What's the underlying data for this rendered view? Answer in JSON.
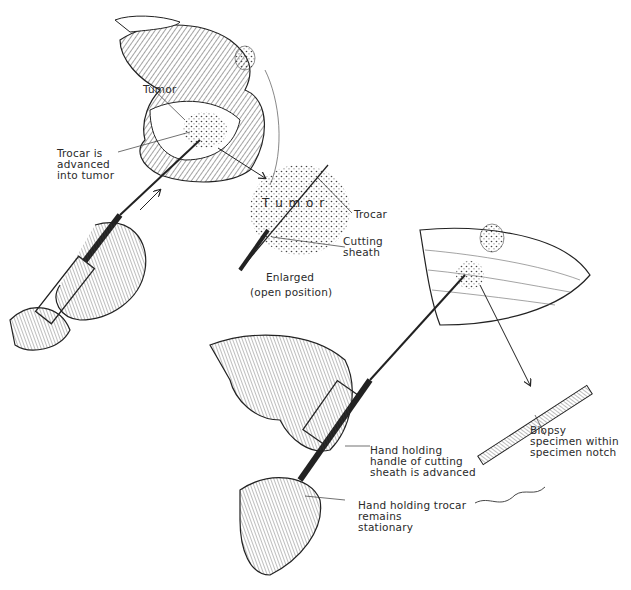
{
  "figure": {
    "labels": {
      "tumor": "Tumor",
      "trocar_advanced": "Trocar is\nadvanced\ninto tumor",
      "tumor_enlarged": "T u m o r",
      "trocar": "Trocar",
      "cutting_sheath": "Cutting\nsheath",
      "enlarged": "Enlarged",
      "open_position": "(open position)",
      "biopsy_specimen": "Biopsy\nspecimen within\nspecimen notch",
      "hand_sheath": "Hand holding\nhandle of cutting\nsheath is advanced",
      "hand_trocar": "Hand holding trocar\nremains\nstationary"
    },
    "colors": {
      "ink": "#1e1e1e",
      "paper": "#ffffff",
      "stipple": "#555555"
    }
  }
}
